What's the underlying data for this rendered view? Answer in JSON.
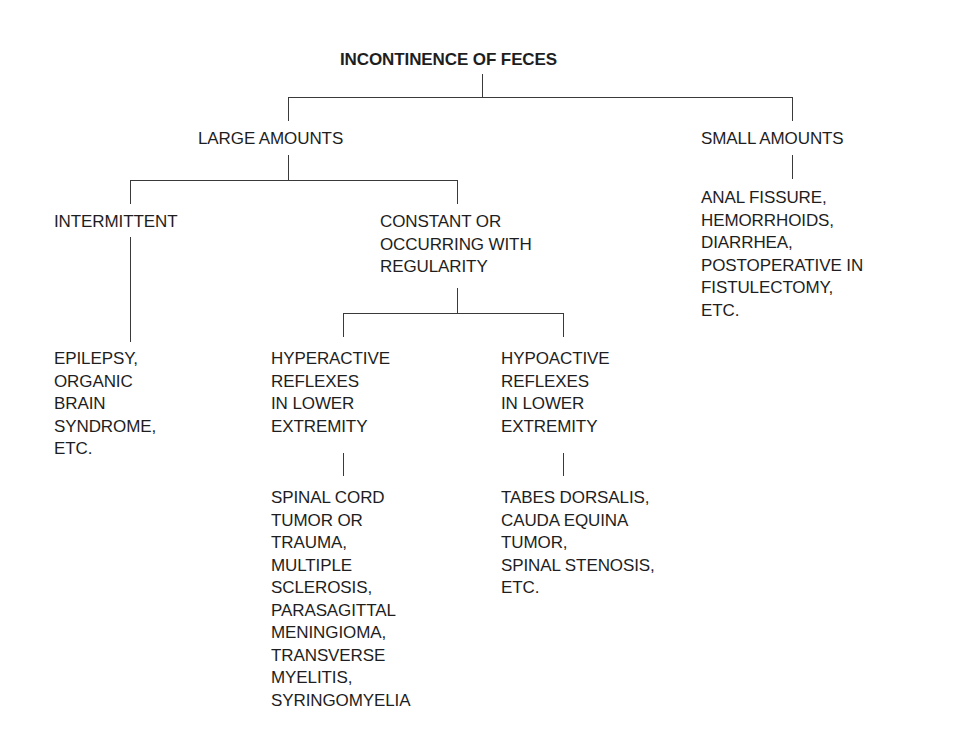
{
  "diagram": {
    "type": "decision-tree",
    "root": {
      "label": "INCONTINENCE OF FECES"
    },
    "large_amounts": {
      "label": "LARGE AMOUNTS",
      "intermittent": {
        "label": "INTERMITTENT",
        "causes": "EPILEPSY,\nORGANIC\nBRAIN\nSYNDROME,\nETC."
      },
      "constant": {
        "label": "CONSTANT OR\nOCCURRING WITH\nREGULARITY",
        "hyperactive": {
          "label": "HYPERACTIVE\nREFLEXES\nIN LOWER\nEXTREMITY",
          "causes": "SPINAL CORD\nTUMOR OR\nTRAUMA,\nMULTIPLE\nSCLEROSIS,\nPARASAGITTAL\nMENINGIOMA,\nTRANSVERSE\nMYELITIS,\nSYRINGOMYELIA"
        },
        "hypoactive": {
          "label": "HYPOACTIVE\nREFLEXES\nIN LOWER\nEXTREMITY",
          "causes": "TABES DORSALIS,\nCAUDA EQUINA\nTUMOR,\nSPINAL STENOSIS,\nETC."
        }
      }
    },
    "small_amounts": {
      "label": "SMALL AMOUNTS",
      "causes": "ANAL FISSURE,\nHEMORRHOIDS,\nDIARRHEA,\nPOSTOPERATIVE IN\nFISTULECTOMY,\nETC."
    }
  }
}
